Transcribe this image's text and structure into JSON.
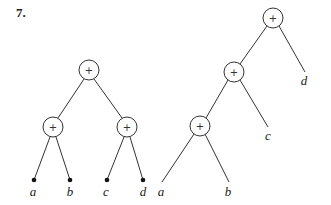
{
  "title": "7.",
  "trees": [
    {
      "name": "balanced-tree",
      "nodes": [
        {
          "id": "root",
          "op": "+",
          "x": 89,
          "y": 70
        },
        {
          "id": "left",
          "op": "+",
          "x": 53,
          "y": 127
        },
        {
          "id": "right",
          "op": "+",
          "x": 127,
          "y": 127
        }
      ],
      "leaves": [
        {
          "label": "a",
          "x": 34,
          "y": 180,
          "dot": true
        },
        {
          "label": "b",
          "x": 70,
          "y": 180,
          "dot": true
        },
        {
          "label": "c",
          "x": 107,
          "y": 180,
          "dot": true
        },
        {
          "label": "d",
          "x": 143,
          "y": 180,
          "dot": true
        }
      ]
    },
    {
      "name": "left-deep-tree",
      "nodes": [
        {
          "id": "root",
          "op": "+",
          "x": 273,
          "y": 18
        },
        {
          "id": "mid",
          "op": "+",
          "x": 234,
          "y": 72
        },
        {
          "id": "bottom",
          "op": "+",
          "x": 200,
          "y": 126
        }
      ],
      "leaves": [
        {
          "label": "d",
          "x": 305,
          "y": 72,
          "dot": false
        },
        {
          "label": "c",
          "x": 268,
          "y": 127,
          "dot": false
        },
        {
          "label": "a",
          "x": 162,
          "y": 182,
          "dot": false
        },
        {
          "label": "b",
          "x": 229,
          "y": 182,
          "dot": false
        }
      ]
    }
  ]
}
